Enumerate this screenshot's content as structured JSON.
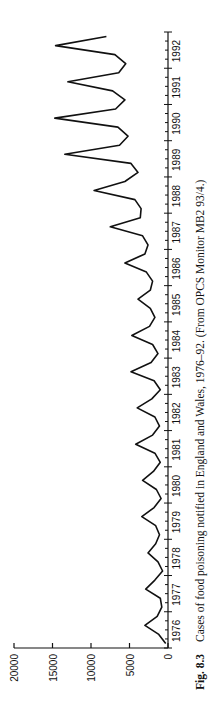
{
  "figure": {
    "label": "Fig. 8.3",
    "caption": "Cases of food poisoning notified in England and Wales, 1976–92. (From OPCS Monitor MB2 93/4.)"
  },
  "chart_data": {
    "type": "line",
    "title": "Cases of food poisoning notified in England and Wales, 1976–92",
    "xlabel": "",
    "ylabel": "",
    "orientation": "rotated 90° counter-clockwise (years run bottom-to-top, values run right-to-left)",
    "frequency": "quarterly",
    "ylim": [
      0,
      20000
    ],
    "yticks": [
      0,
      5000,
      10000,
      15000,
      20000
    ],
    "ytick_labels": [
      "0",
      "5000",
      "10000",
      "15000",
      "20000"
    ],
    "xlim": [
      1976,
      1993
    ],
    "xtick_labels": [
      "1976",
      "1977",
      "1978",
      "1979",
      "1980",
      "1981",
      "1982",
      "1983",
      "1984",
      "1985",
      "1986",
      "1987",
      "1988",
      "1989",
      "1990",
      "1991",
      "1992"
    ],
    "grid": false,
    "legend": null,
    "x": [
      "1976 Q1",
      "1976 Q2",
      "1976 Q3",
      "1976 Q4",
      "1977 Q1",
      "1977 Q2",
      "1977 Q3",
      "1977 Q4",
      "1978 Q1",
      "1978 Q2",
      "1978 Q3",
      "1978 Q4",
      "1979 Q1",
      "1979 Q2",
      "1979 Q3",
      "1979 Q4",
      "1980 Q1",
      "1980 Q2",
      "1980 Q3",
      "1980 Q4",
      "1981 Q1",
      "1981 Q2",
      "1981 Q3",
      "1981 Q4",
      "1982 Q1",
      "1982 Q2",
      "1982 Q3",
      "1982 Q4",
      "1983 Q1",
      "1983 Q2",
      "1983 Q3",
      "1983 Q4",
      "1984 Q1",
      "1984 Q2",
      "1984 Q3",
      "1984 Q4",
      "1985 Q1",
      "1985 Q2",
      "1985 Q3",
      "1985 Q4",
      "1986 Q1",
      "1986 Q2",
      "1986 Q3",
      "1986 Q4",
      "1987 Q1",
      "1987 Q2",
      "1987 Q3",
      "1987 Q4",
      "1988 Q1",
      "1988 Q2",
      "1988 Q3",
      "1988 Q4",
      "1989 Q1",
      "1989 Q2",
      "1989 Q3",
      "1989 Q4",
      "1990 Q1",
      "1990 Q2",
      "1990 Q3",
      "1990 Q4",
      "1991 Q1",
      "1991 Q2",
      "1991 Q3",
      "1991 Q4",
      "1992 Q1",
      "1992 Q2",
      "1992 Q3",
      "1992 Q4"
    ],
    "series": [
      {
        "name": "Notified cases",
        "values": [
          300,
          1200,
          3000,
          1400,
          800,
          1000,
          2900,
          1700,
          700,
          1300,
          2600,
          1600,
          1100,
          1600,
          3400,
          1800,
          900,
          1500,
          3300,
          1900,
          1000,
          1700,
          4200,
          2000,
          1100,
          1700,
          4000,
          2100,
          1000,
          1800,
          4800,
          2200,
          1300,
          2000,
          4700,
          2400,
          1700,
          2300,
          3900,
          2300,
          2000,
          2800,
          5600,
          3000,
          2600,
          3300,
          7500,
          3600,
          3500,
          4300,
          9600,
          5600,
          3900,
          4800,
          13400,
          6300,
          5200,
          6500,
          14700,
          6800,
          5600,
          7200,
          13000,
          6400,
          5500,
          6900,
          14600,
          8000
        ]
      }
    ]
  }
}
